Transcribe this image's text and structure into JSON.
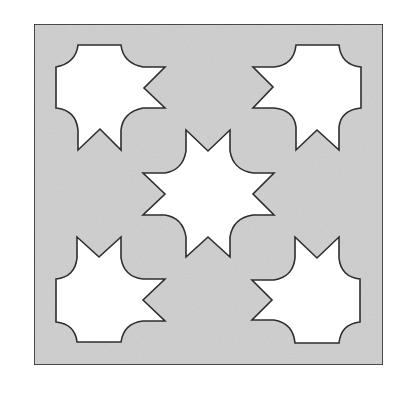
{
  "diagram": {
    "type": "geometric-tile-pattern",
    "colors": {
      "background": "#ffffff",
      "panel_fill": "#d3d3d3",
      "cutout_fill": "#ffffff",
      "stroke": "#2e2e2e"
    },
    "panel": {
      "x": 34,
      "y": 24,
      "width": 349,
      "height": 341
    },
    "shapes": [
      {
        "name": "top-left-cutout",
        "path": "M78,45 L121,45 Q123,63 143,67 L165,67 L144,88 L165,108 L143,108 Q123,112 121,130 L121,150 L100,129 L78,150 L78,130 Q76,110 56,108 L56,67 Q76,63 78,45 Z"
      },
      {
        "name": "top-right-cutout",
        "path": "M296,45 L339,45 Q341,65 361,67 L361,108 Q341,110 339,127 L339,150 L317,130 L296,150 L296,127 Q294,110 274,108 L253,108 L273,87 L253,67 L274,67 Q294,65 296,45 Z"
      },
      {
        "name": "center-star-cutout",
        "path": "M186,130 L208,151 L230,130 L230,151 Q233,170 253,173 L274,173 L253,194 L274,215 L253,215 Q233,218 230,237 L230,257 L208,237 L186,257 L186,237 Q183,218 165,215 L143,215 L165,194 L143,173 L165,173 Q183,170 186,151 Z"
      },
      {
        "name": "bottom-left-cutout",
        "path": "M77,237 L99,257 L121,237 L121,258 Q124,277 143,279 L165,279 L143,300 L165,321 L143,321 Q124,323 121,342 L77,342 Q75,324 56,322 L56,279 Q75,277 77,258 Z"
      },
      {
        "name": "bottom-right-cutout",
        "path": "M295,237 L317,258 L339,237 L339,258 Q341,277 360,279 L360,322 Q341,324 339,343 L295,343 Q293,323 274,320 L252,320 L272,300 L252,280 L274,280 Q293,277 295,258 Z"
      }
    ]
  }
}
